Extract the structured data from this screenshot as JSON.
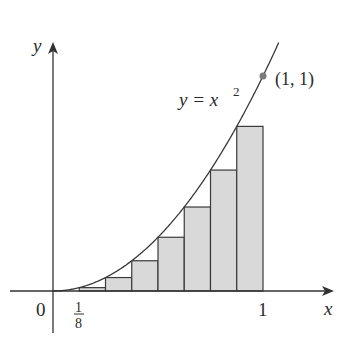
{
  "chart_data": {
    "type": "area",
    "title": "",
    "function": "y = x^2",
    "curve_label": "y = x",
    "curve_label_exp": "2",
    "xlabel": "x",
    "ylabel": "y",
    "origin_label": "0",
    "tick_labels": {
      "one": "1",
      "frac_num": "1",
      "frac_den": "8"
    },
    "point_label": "(1, 1)",
    "point": [
      1,
      1
    ],
    "xlim": [
      0,
      1
    ],
    "ylim": [
      0,
      1
    ],
    "rectangles": {
      "n": 8,
      "rule": "left endpoints",
      "left_x": [
        0,
        0.125,
        0.25,
        0.375,
        0.5,
        0.625,
        0.75,
        0.875
      ],
      "heights": [
        0,
        0.015625,
        0.0625,
        0.140625,
        0.25,
        0.390625,
        0.5625,
        0.765625
      ]
    },
    "colors": {
      "fill": "#d9d9d9",
      "stroke": "#3a3a3a",
      "point": "#7a7a7a"
    }
  }
}
